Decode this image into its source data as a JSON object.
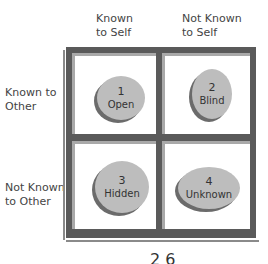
{
  "diagram": {
    "column_headers": [
      {
        "line1": "Known",
        "line2": "to Self"
      },
      {
        "line1": "Not Known",
        "line2": "to Self"
      }
    ],
    "row_headers": [
      {
        "line1": "Known to",
        "line2": "Other"
      },
      {
        "line1": "Not Known",
        "line2": "to Other"
      }
    ],
    "quadrants": [
      {
        "number": "1",
        "label": "Open"
      },
      {
        "number": "2",
        "label": "Blind"
      },
      {
        "number": "3",
        "label": "Hidden"
      },
      {
        "number": "4",
        "label": "Unknown"
      }
    ],
    "footer_fragment": "2 6",
    "colors": {
      "frame": "#5a5a5a",
      "frame_shadow": "#8a8a8a",
      "oval_fill": "#bdbdbd",
      "oval_shadow": "#6b6b6b"
    }
  }
}
